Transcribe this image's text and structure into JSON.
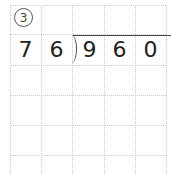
{
  "problem": {
    "label": "3",
    "divisor": [
      "7",
      "6"
    ],
    "dividend": [
      "9",
      "6",
      "0"
    ]
  },
  "grid": {
    "columns": 5,
    "rows": 6,
    "line_color": "#c8c8c8"
  }
}
